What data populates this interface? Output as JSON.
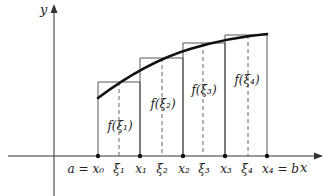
{
  "diagram": {
    "axes": {
      "x_label": "x",
      "y_label": "y"
    },
    "tick_labels": [
      {
        "id": "x0",
        "text": "a = x₀"
      },
      {
        "id": "xi1",
        "text": "ξ₁"
      },
      {
        "id": "x1",
        "text": "x₁"
      },
      {
        "id": "xi2",
        "text": "ξ₂"
      },
      {
        "id": "x2",
        "text": "x₂"
      },
      {
        "id": "xi3",
        "text": "ξ₃"
      },
      {
        "id": "x3",
        "text": "x₃"
      },
      {
        "id": "xi4",
        "text": "ξ₄"
      },
      {
        "id": "x4",
        "text": "x₄ = b"
      }
    ],
    "rectangle_labels": [
      {
        "text": "f(ξ₁)"
      },
      {
        "text": "f(ξ₂)"
      },
      {
        "text": "f(ξ₃)"
      },
      {
        "text": "f(ξ₄)"
      }
    ],
    "colors": {
      "background": "#ffffff",
      "ink": "#222222"
    }
  }
}
